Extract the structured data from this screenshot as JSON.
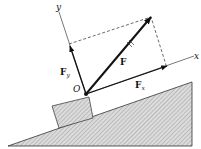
{
  "diagram": {
    "labels": {
      "y_axis": "y",
      "x_axis": "x",
      "origin": "O",
      "force": "F",
      "force_y": "F",
      "force_y_sub": "y",
      "force_x": "F",
      "force_x_sub": "x"
    },
    "colors": {
      "line": "#111111",
      "hatch_fill": "#cfcfcf",
      "background": "#ffffff"
    }
  }
}
